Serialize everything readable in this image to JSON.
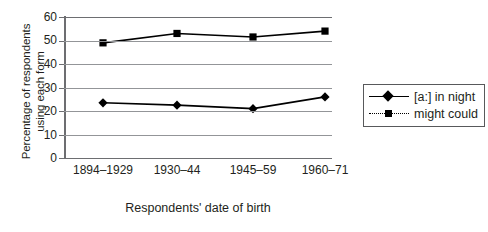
{
  "chart_data": {
    "type": "line",
    "title": "",
    "xlabel": "Respondents' date of birth",
    "ylabel_lines": [
      "Percentage of respondents",
      "using each form"
    ],
    "ylabel": "Percentage of respondents using each form",
    "categories": [
      "1894–1929",
      "1930–44",
      "1945–59",
      "1960–71"
    ],
    "ylim": [
      0,
      60
    ],
    "yticks": [
      0,
      10,
      20,
      30,
      40,
      50,
      60
    ],
    "grid": true,
    "legend_position": "right",
    "series": [
      {
        "name": "[a:] in night",
        "values": [
          23.5,
          22.5,
          21,
          26
        ],
        "marker": "diamond",
        "line_style": "solid",
        "color": "#000000"
      },
      {
        "name": "might could",
        "values": [
          49,
          53,
          51.5,
          54
        ],
        "marker": "square",
        "line_style": "dotted",
        "color": "#000000"
      }
    ]
  },
  "axes": {
    "y_tick_labels": [
      "60",
      "50",
      "40",
      "30",
      "20",
      "10",
      "0"
    ],
    "x_tick_labels": [
      "1894–1929",
      "1930–44",
      "1945–59",
      "1960–71"
    ]
  },
  "legend": {
    "items": [
      {
        "label": "[a:] in night",
        "marker": "diamond",
        "style": "solid"
      },
      {
        "label": "might could",
        "marker": "square",
        "style": "dotted"
      }
    ]
  },
  "colors": {
    "series": "#000000",
    "grid": "#939598",
    "axis": "#6d6e71",
    "text": "#231f20",
    "background": "#ffffff"
  }
}
